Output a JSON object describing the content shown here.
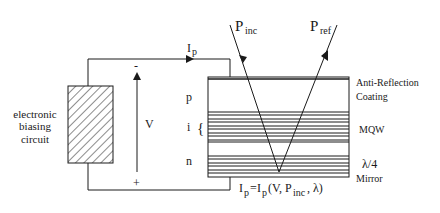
{
  "diagram": {
    "circuit": {
      "label_lines": [
        "electronic",
        "biasing",
        "circuit"
      ],
      "current_label": "I",
      "current_sub": "p",
      "voltage_label": "V",
      "minus_sign": "-",
      "plus_sign": "+"
    },
    "device": {
      "layers": [
        {
          "id": "p",
          "label": "p"
        },
        {
          "id": "i",
          "label": "i"
        },
        {
          "id": "n",
          "label": "n"
        }
      ],
      "brace": "{",
      "annotations": {
        "arc_line1": "Anti-Reflection",
        "arc_line2": "Coating",
        "mqw": "MQW",
        "mirror_line1": "λ/4",
        "mirror_line2": "Mirror"
      }
    },
    "beams": {
      "incident": {
        "main": "P",
        "sub": "inc"
      },
      "reflected": {
        "main": "P",
        "sub": "ref"
      }
    },
    "equation": {
      "lhs_main": "I",
      "lhs_sub": "p",
      "equals": "=",
      "rhs_main": "I",
      "rhs_sub": "p",
      "open": "(V, P",
      "arg_sub": "inc",
      "close": ", λ)"
    },
    "colors": {
      "line": "#1a1a1a",
      "background": "#ffffff"
    }
  }
}
